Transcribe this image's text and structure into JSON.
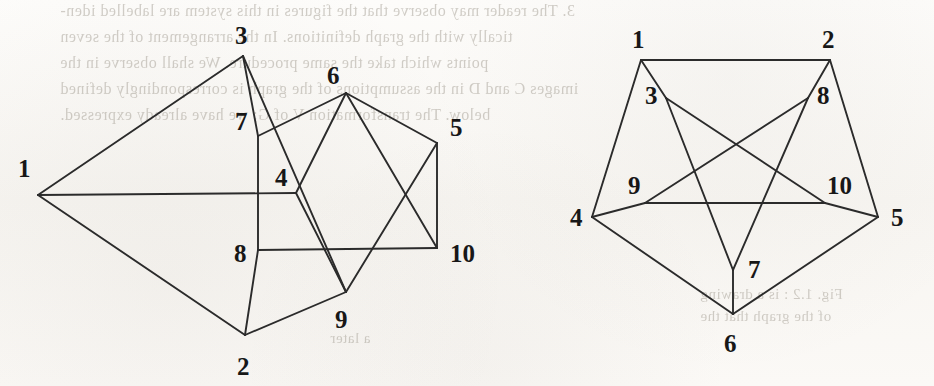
{
  "figure": {
    "background_color": "#fbfaf8",
    "edge_color": "#2b2b2b",
    "label_color": "#171717"
  },
  "bleed_through_text": {
    "line1": "3. The reader may observe that the figures in this system are labelled iden-",
    "line2": "tically with the graph definitions. In the arrangement of the seven",
    "line3": "points which take the same procedure. We shall observe in the",
    "line4": "images C and D in the assumptions of the graph is correspondingly defined",
    "line5": "below. The transformation V of G; we have already expressed.",
    "right1": "Fig. 1.2 : is a drawing",
    "right2": "of the graph that the",
    "mid1": "a later"
  },
  "graphs": [
    {
      "name": "left-drawing",
      "vertices": [
        {
          "id": "1",
          "label": "1",
          "x": 38,
          "y": 195,
          "label_x": 18,
          "label_y": 177
        },
        {
          "id": "2",
          "label": "2",
          "x": 245,
          "y": 335,
          "label_x": 237,
          "label_y": 375
        },
        {
          "id": "3",
          "label": "3",
          "x": 243,
          "y": 56,
          "label_x": 235,
          "label_y": 44
        },
        {
          "id": "4",
          "label": "4",
          "x": 296,
          "y": 193,
          "label_x": 275,
          "label_y": 186
        },
        {
          "id": "5",
          "label": "5",
          "x": 437,
          "y": 143,
          "label_x": 450,
          "label_y": 136
        },
        {
          "id": "6",
          "label": "6",
          "x": 346,
          "y": 93,
          "label_x": 327,
          "label_y": 84
        },
        {
          "id": "7",
          "label": "7",
          "x": 258,
          "y": 136,
          "label_x": 235,
          "label_y": 130
        },
        {
          "id": "8",
          "label": "8",
          "x": 258,
          "y": 250,
          "label_x": 234,
          "label_y": 262
        },
        {
          "id": "9",
          "label": "9",
          "x": 346,
          "y": 292,
          "label_x": 335,
          "label_y": 328
        },
        {
          "id": "10",
          "label": "10",
          "x": 437,
          "y": 248,
          "label_x": 450,
          "label_y": 262
        }
      ],
      "edges": [
        [
          "1",
          "3"
        ],
        [
          "1",
          "2"
        ],
        [
          "1",
          "4"
        ],
        [
          "3",
          "7"
        ],
        [
          "3",
          "9"
        ],
        [
          "7",
          "6"
        ],
        [
          "7",
          "8"
        ],
        [
          "6",
          "5"
        ],
        [
          "6",
          "10"
        ],
        [
          "5",
          "9"
        ],
        [
          "5",
          "10"
        ],
        [
          "4",
          "6"
        ],
        [
          "4",
          "9"
        ],
        [
          "8",
          "2"
        ],
        [
          "8",
          "10"
        ],
        [
          "2",
          "9"
        ]
      ]
    },
    {
      "name": "right-drawing",
      "vertices": [
        {
          "id": "1",
          "label": "1",
          "x": 641,
          "y": 60,
          "label_x": 632,
          "label_y": 48
        },
        {
          "id": "2",
          "label": "2",
          "x": 830,
          "y": 60,
          "label_x": 822,
          "label_y": 48
        },
        {
          "id": "3",
          "label": "3",
          "x": 666,
          "y": 98,
          "label_x": 645,
          "label_y": 104
        },
        {
          "id": "4",
          "label": "4",
          "x": 592,
          "y": 217,
          "label_x": 570,
          "label_y": 226
        },
        {
          "id": "5",
          "label": "5",
          "x": 878,
          "y": 217,
          "label_x": 891,
          "label_y": 226
        },
        {
          "id": "6",
          "label": "6",
          "x": 733,
          "y": 314,
          "label_x": 724,
          "label_y": 352
        },
        {
          "id": "7",
          "label": "7",
          "x": 733,
          "y": 270,
          "label_x": 748,
          "label_y": 278
        },
        {
          "id": "8",
          "label": "8",
          "x": 808,
          "y": 98,
          "label_x": 817,
          "label_y": 104
        },
        {
          "id": "9",
          "label": "9",
          "x": 645,
          "y": 203,
          "label_x": 628,
          "label_y": 194
        },
        {
          "id": "10",
          "label": "10",
          "x": 825,
          "y": 203,
          "label_x": 827,
          "label_y": 194
        }
      ],
      "edges": [
        [
          "1",
          "2"
        ],
        [
          "1",
          "4"
        ],
        [
          "1",
          "3"
        ],
        [
          "2",
          "5"
        ],
        [
          "2",
          "8"
        ],
        [
          "4",
          "6"
        ],
        [
          "4",
          "9"
        ],
        [
          "5",
          "6"
        ],
        [
          "5",
          "10"
        ],
        [
          "9",
          "10"
        ],
        [
          "3",
          "7"
        ],
        [
          "3",
          "10"
        ],
        [
          "8",
          "7"
        ],
        [
          "8",
          "9"
        ],
        [
          "6",
          "7"
        ]
      ]
    }
  ]
}
